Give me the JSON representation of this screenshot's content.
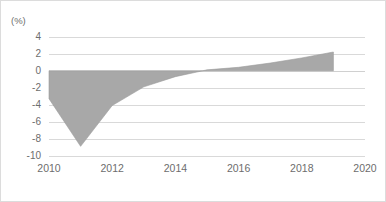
{
  "chart_data": {
    "type": "area",
    "title": "",
    "subtitle": "",
    "xlabel": "",
    "ylabel": "(%)",
    "unit_label": "(%)",
    "x": [
      2010,
      2011,
      2012,
      2013,
      2014,
      2015,
      2016,
      2017,
      2018,
      2019
    ],
    "values": [
      -3.3,
      -8.9,
      -4.1,
      -1.9,
      -0.7,
      0.1,
      0.4,
      0.9,
      1.5,
      2.2
    ],
    "series": [
      {
        "name": "",
        "values": [
          -3.3,
          -8.9,
          -4.1,
          -1.9,
          -0.7,
          0.1,
          0.4,
          0.9,
          1.5,
          2.2
        ]
      }
    ],
    "xlim": [
      2010,
      2020
    ],
    "ylim": [
      -10,
      4
    ],
    "xticks": [
      2010,
      2012,
      2014,
      2016,
      2018,
      2020
    ],
    "xtick_labels": [
      "2010",
      "2012",
      "2014",
      "2016",
      "2018",
      "2020"
    ],
    "yticks": [
      4,
      2,
      0,
      -2,
      -4,
      -6,
      -8,
      -10
    ],
    "ytick_labels": [
      "4",
      "2",
      "0",
      "-2",
      "-4",
      "-6",
      "-8",
      "-10"
    ],
    "grid": true,
    "grid_axis": "y",
    "legend": false,
    "legend_position": "none",
    "colors": {
      "area_fill": "#a8a8a8",
      "area_stroke": "#9a9a9a",
      "gridline": "#d9d9d9",
      "axis_text": "#6d6d6d",
      "frame_border": "#dcdcdc",
      "background": "#ffffff"
    }
  }
}
